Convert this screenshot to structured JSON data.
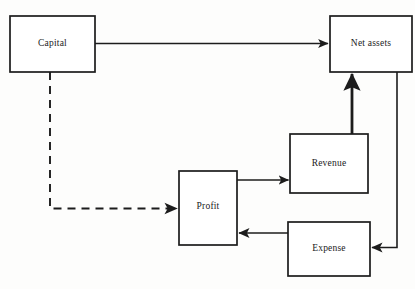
{
  "diagram": {
    "background_color": "#fdfdfc",
    "line_color": "#1c1c1c",
    "text_color": "#1a1a1a",
    "nodes": [
      {
        "id": "capital",
        "label": "Capital",
        "x": 10,
        "y": 16,
        "w": 85,
        "h": 56
      },
      {
        "id": "net_assets",
        "label": "Net assets",
        "x": 330,
        "y": 16,
        "w": 82,
        "h": 56
      },
      {
        "id": "revenue",
        "label": "Revenue",
        "x": 290,
        "y": 134,
        "w": 78,
        "h": 59
      },
      {
        "id": "profit",
        "label": "Profit",
        "x": 179,
        "y": 171,
        "w": 58,
        "h": 74
      },
      {
        "id": "expense",
        "label": "Expense",
        "x": 288,
        "y": 222,
        "w": 82,
        "h": 54
      }
    ],
    "edges": [
      {
        "id": "capital-to-net-assets",
        "from": "capital",
        "to": "net_assets",
        "style": "solid"
      },
      {
        "id": "capital-to-profit",
        "from": "capital",
        "to": "profit",
        "style": "dashed"
      },
      {
        "id": "profit-to-revenue",
        "from": "profit",
        "to": "revenue",
        "style": "solid"
      },
      {
        "id": "revenue-to-net-assets",
        "from": "revenue",
        "to": "net_assets",
        "style": "solid"
      },
      {
        "id": "net-assets-to-expense",
        "from": "net_assets",
        "to": "expense",
        "style": "solid"
      },
      {
        "id": "expense-to-profit",
        "from": "expense",
        "to": "profit",
        "style": "solid"
      }
    ]
  }
}
